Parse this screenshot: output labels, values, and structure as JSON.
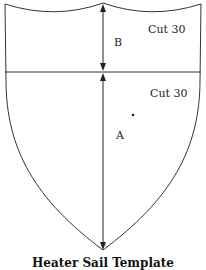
{
  "diagram": {
    "type": "shield-template",
    "pieces": [
      {
        "name": "top-section",
        "label": "Cut 30",
        "dimension": "B"
      },
      {
        "name": "bottom-section",
        "label": "Cut 30",
        "dimension": "A"
      }
    ],
    "labels": {
      "top_cut": "Cut 30",
      "bottom_cut": "Cut 30",
      "dim_b": "B",
      "dim_a": "A"
    },
    "caption": "Heater Sail Template",
    "colors": {
      "line": "#222222",
      "background": "#ffffff"
    }
  }
}
